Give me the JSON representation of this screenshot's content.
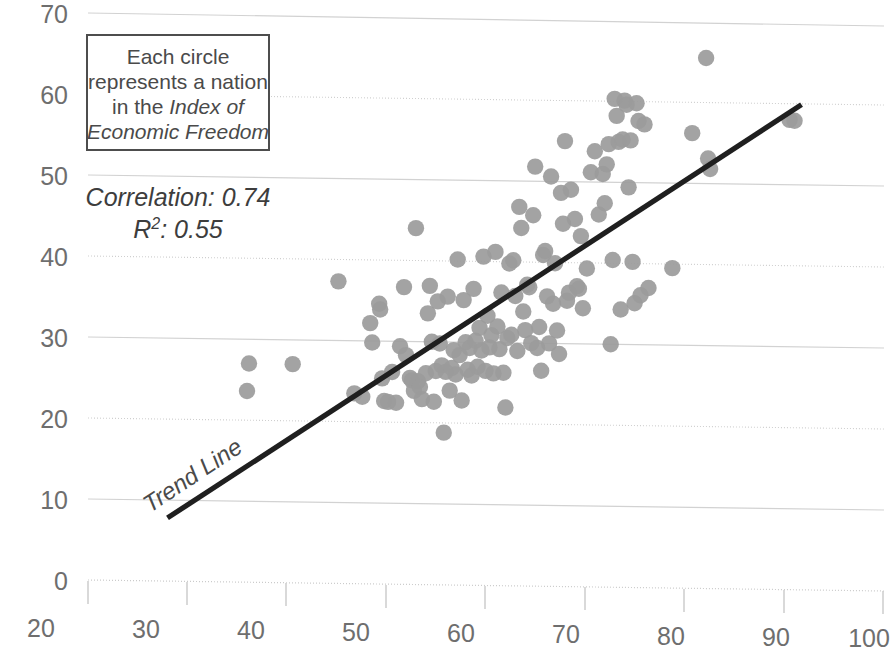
{
  "chart_data": {
    "type": "scatter",
    "title": "",
    "xlabel": "",
    "ylabel": "",
    "xlim": [
      20,
      100
    ],
    "ylim": [
      0,
      70
    ],
    "grid": true,
    "legend": "none",
    "xticks": [
      "20",
      "30",
      "40",
      "50",
      "60",
      "70",
      "80",
      "90",
      "100"
    ],
    "yticks": [
      "0",
      "10",
      "20",
      "30",
      "40",
      "50",
      "60",
      "70"
    ],
    "xtick_values": [
      20,
      30,
      40,
      50,
      60,
      70,
      80,
      90,
      100
    ],
    "ytick_values": [
      0,
      10,
      20,
      30,
      40,
      50,
      60,
      70
    ],
    "series": [
      {
        "name": "Nations",
        "marker": "circle",
        "color": "#9b9b9b",
        "points": [
          [
            36.2,
            27.0
          ],
          [
            36.0,
            23.6
          ],
          [
            40.6,
            27.0
          ],
          [
            45.2,
            37.3
          ],
          [
            46.8,
            23.5
          ],
          [
            47.6,
            23.1
          ],
          [
            48.4,
            32.2
          ],
          [
            48.6,
            29.8
          ],
          [
            49.3,
            34.6
          ],
          [
            49.4,
            33.9
          ],
          [
            49.6,
            25.4
          ],
          [
            49.8,
            22.6
          ],
          [
            50.2,
            22.5
          ],
          [
            50.6,
            26.2
          ],
          [
            51.0,
            22.4
          ],
          [
            51.4,
            29.4
          ],
          [
            51.8,
            36.7
          ],
          [
            52.0,
            28.3
          ],
          [
            52.4,
            25.5
          ],
          [
            52.6,
            25.2
          ],
          [
            52.8,
            23.9
          ],
          [
            53.0,
            44.0
          ],
          [
            53.2,
            25.1
          ],
          [
            53.4,
            24.4
          ],
          [
            53.6,
            22.9
          ],
          [
            54.0,
            26.1
          ],
          [
            54.2,
            33.5
          ],
          [
            54.4,
            36.9
          ],
          [
            54.6,
            30.0
          ],
          [
            54.8,
            22.6
          ],
          [
            55.0,
            26.4
          ],
          [
            55.2,
            35.0
          ],
          [
            55.4,
            29.8
          ],
          [
            55.6,
            27.1
          ],
          [
            55.8,
            18.8
          ],
          [
            56.0,
            26.3
          ],
          [
            56.2,
            35.6
          ],
          [
            56.4,
            24.0
          ],
          [
            56.6,
            26.8
          ],
          [
            56.8,
            29.0
          ],
          [
            57.0,
            26.0
          ],
          [
            57.2,
            40.2
          ],
          [
            57.4,
            28.4
          ],
          [
            57.6,
            22.8
          ],
          [
            57.8,
            35.2
          ],
          [
            58.0,
            30.0
          ],
          [
            58.2,
            26.6
          ],
          [
            58.4,
            29.3
          ],
          [
            58.6,
            25.9
          ],
          [
            58.8,
            36.6
          ],
          [
            59.0,
            30.2
          ],
          [
            59.2,
            27.0
          ],
          [
            59.4,
            31.8
          ],
          [
            59.6,
            29.0
          ],
          [
            59.8,
            40.6
          ],
          [
            60.0,
            26.5
          ],
          [
            60.2,
            33.3
          ],
          [
            60.4,
            29.4
          ],
          [
            60.6,
            30.9
          ],
          [
            60.8,
            26.2
          ],
          [
            61.0,
            41.2
          ],
          [
            61.2,
            32.0
          ],
          [
            61.4,
            29.2
          ],
          [
            61.6,
            36.2
          ],
          [
            61.8,
            26.3
          ],
          [
            62.0,
            22.0
          ],
          [
            62.2,
            30.6
          ],
          [
            62.4,
            39.8
          ],
          [
            62.6,
            31.0
          ],
          [
            62.8,
            40.2
          ],
          [
            63.0,
            35.8
          ],
          [
            63.2,
            29.0
          ],
          [
            63.4,
            46.8
          ],
          [
            63.6,
            44.2
          ],
          [
            63.8,
            33.9
          ],
          [
            64.0,
            31.6
          ],
          [
            64.2,
            37.2
          ],
          [
            64.4,
            36.9
          ],
          [
            64.6,
            30.0
          ],
          [
            64.8,
            45.8
          ],
          [
            65.0,
            51.8
          ],
          [
            65.2,
            29.4
          ],
          [
            65.4,
            32.0
          ],
          [
            65.6,
            26.6
          ],
          [
            65.8,
            40.9
          ],
          [
            66.0,
            41.4
          ],
          [
            66.2,
            35.8
          ],
          [
            66.4,
            30.0
          ],
          [
            66.6,
            50.6
          ],
          [
            66.8,
            34.9
          ],
          [
            67.0,
            39.9
          ],
          [
            67.2,
            31.6
          ],
          [
            67.4,
            28.7
          ],
          [
            67.6,
            48.6
          ],
          [
            67.8,
            44.8
          ],
          [
            68.0,
            55.0
          ],
          [
            68.2,
            35.3
          ],
          [
            68.4,
            36.3
          ],
          [
            68.6,
            49.0
          ],
          [
            69.0,
            45.4
          ],
          [
            69.2,
            37.1
          ],
          [
            69.4,
            36.8
          ],
          [
            69.6,
            43.3
          ],
          [
            69.8,
            34.4
          ],
          [
            70.2,
            39.3
          ],
          [
            70.6,
            51.2
          ],
          [
            71.0,
            53.8
          ],
          [
            71.4,
            46.0
          ],
          [
            71.8,
            51.0
          ],
          [
            72.0,
            47.4
          ],
          [
            72.2,
            52.2
          ],
          [
            72.4,
            54.7
          ],
          [
            72.6,
            30.0
          ],
          [
            72.8,
            40.4
          ],
          [
            73.0,
            60.3
          ],
          [
            73.2,
            58.2
          ],
          [
            73.4,
            55.0
          ],
          [
            73.6,
            34.3
          ],
          [
            73.8,
            55.3
          ],
          [
            74.0,
            60.1
          ],
          [
            74.2,
            59.6
          ],
          [
            74.4,
            49.4
          ],
          [
            74.6,
            55.2
          ],
          [
            74.8,
            40.2
          ],
          [
            75.0,
            35.1
          ],
          [
            75.2,
            59.8
          ],
          [
            75.4,
            57.6
          ],
          [
            75.6,
            36.1
          ],
          [
            76.0,
            57.2
          ],
          [
            76.4,
            37.0
          ],
          [
            78.8,
            39.5
          ],
          [
            80.8,
            56.2
          ],
          [
            82.2,
            65.5
          ],
          [
            82.4,
            53.1
          ],
          [
            82.6,
            51.8
          ],
          [
            90.6,
            58.0
          ],
          [
            91.1,
            57.9
          ]
        ]
      }
    ],
    "trendline": {
      "label": "Trend Line",
      "x_start": 28.0,
      "y_start": 7.8,
      "x_end": 91.8,
      "y_end": 59.9,
      "color": "#1f1f1f"
    },
    "annotations": {
      "callout": {
        "lines": [
          {
            "text": "Each circle",
            "italic": false
          },
          {
            "text": "represents a nation",
            "italic": false
          },
          {
            "text": "in the ",
            "italic_suffix": "Index of"
          },
          {
            "text": "Economic Freedom",
            "italic": true
          }
        ],
        "line1": "Each circle",
        "line2": "represents a nation",
        "line3_plain": "in the ",
        "line3_italic": "Index of",
        "line4_italic": "Economic Freedom",
        "border_color": "#4d4d4d"
      },
      "stats": {
        "correlation_label": "Correlation: 0.74",
        "r2_prefix": "R",
        "r2_sup": "2",
        "r2_value": ": 0.55"
      }
    }
  }
}
